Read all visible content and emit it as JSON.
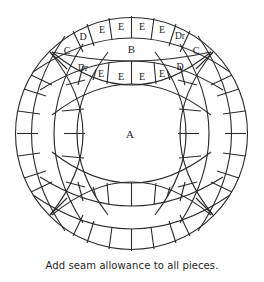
{
  "figure": {
    "caption": "Add seam allowance to all pieces.",
    "labels": {
      "center": "A",
      "top_lens": "B",
      "corner_left": "C",
      "corner_right": "C",
      "top_outer_strip": [
        "D",
        "E",
        "E",
        "E",
        "E",
        "Dr"
      ],
      "top_inner_strip": [
        "Dr",
        "E",
        "E",
        "E",
        "E",
        "D"
      ]
    },
    "colors": {
      "line": "#2b2b2b",
      "text": "#1e1e1e",
      "background": "#ffffff"
    }
  }
}
